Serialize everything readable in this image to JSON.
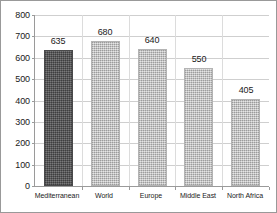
{
  "chart_data": {
    "type": "bar",
    "title": "",
    "subtitle": "",
    "xlabel": "",
    "ylabel": "",
    "categories": [
      "Mediterranean",
      "World",
      "Europe",
      "Middle East",
      "North Africa"
    ],
    "values": [
      635,
      680,
      640,
      550,
      405
    ],
    "value_labels": [
      "635",
      "680",
      "640",
      "550",
      "405"
    ],
    "ylim": [
      0,
      800
    ],
    "ytick_step": 100,
    "ytick_labels": [
      "0",
      "100",
      "200",
      "300",
      "400",
      "500",
      "600",
      "700",
      "800"
    ],
    "ytick_values": [
      0,
      100,
      200,
      300,
      400,
      500,
      600,
      700,
      800
    ],
    "grid": {
      "horizontal": true,
      "vertical": true
    },
    "legend": {
      "visible": false,
      "position": "none",
      "entries": []
    },
    "bar_styles": [
      "dark",
      "light",
      "light",
      "light",
      "light"
    ],
    "colors": {
      "bar_dark": "#59595a",
      "bar_light": "#c2c2c2",
      "gridline": "#cfcfcf",
      "axis": "#9a9a9a",
      "text": "#1a1a1a",
      "background": "#ffffff",
      "frame_border": "#999999"
    }
  }
}
